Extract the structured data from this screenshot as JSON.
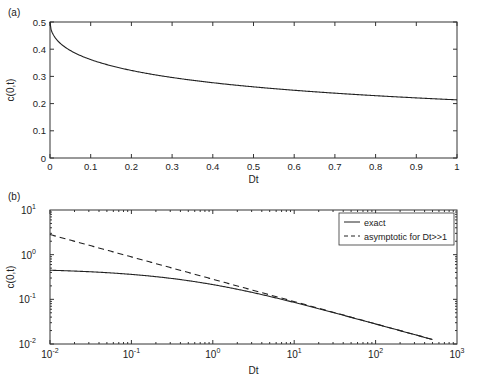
{
  "chart_data": [
    {
      "panel_label": "(a)",
      "type": "line",
      "xlabel": "Dt",
      "ylabel": "c(0,t)",
      "xlim": [
        0,
        1
      ],
      "ylim": [
        0,
        0.5
      ],
      "xticks": [
        "0",
        "0.1",
        "0.2",
        "0.3",
        "0.4",
        "0.5",
        "0.6",
        "0.7",
        "0.8",
        "0.9",
        "1"
      ],
      "yticks": [
        "0",
        "0.1",
        "0.2",
        "0.3",
        "0.4",
        "0.5"
      ],
      "grid": false,
      "series": [
        {
          "name": "exact",
          "style": "solid",
          "x": [
            0,
            0.01,
            0.02,
            0.05,
            0.1,
            0.2,
            0.3,
            0.4,
            0.5,
            0.6,
            0.7,
            0.8,
            0.9,
            1.0
          ],
          "y": [
            0.5,
            0.45,
            0.43,
            0.4,
            0.37,
            0.33,
            0.3,
            0.28,
            0.264,
            0.25,
            0.238,
            0.228,
            0.22,
            0.213
          ]
        }
      ]
    },
    {
      "panel_label": "(b)",
      "type": "line",
      "xscale": "log",
      "yscale": "log",
      "xlabel": "Dt",
      "ylabel": "c(0,t)",
      "xlim": [
        0.01,
        1000
      ],
      "ylim": [
        0.01,
        10
      ],
      "xticks": [
        "10^-2",
        "10^-1",
        "10^0",
        "10^1",
        "10^2",
        "10^3"
      ],
      "yticks": [
        "10^-2",
        "10^-1",
        "10^0",
        "10^1"
      ],
      "legend": {
        "position": "upper right",
        "entries": [
          "exact",
          "asymptotic for Dt>>1"
        ]
      },
      "series": [
        {
          "name": "exact",
          "style": "solid",
          "x": [
            0.01,
            0.03,
            0.1,
            0.3,
            1,
            3,
            10,
            30,
            100,
            500
          ],
          "y": [
            0.45,
            0.42,
            0.37,
            0.31,
            0.213,
            0.14,
            0.085,
            0.05,
            0.028,
            0.0126
          ]
        },
        {
          "name": "asymptotic for Dt>>1",
          "style": "dashed",
          "x": [
            0.01,
            0.1,
            1,
            10,
            100,
            500
          ],
          "y": [
            2.82,
            0.89,
            0.282,
            0.089,
            0.0282,
            0.0126
          ]
        }
      ]
    }
  ],
  "labels": {
    "panel_a": "(a)",
    "panel_b": "(b)",
    "xlabel": "Dt",
    "ylabel": "c(0,t)",
    "legend_exact": "exact",
    "legend_asym": "asymptotic for Dt>>1"
  }
}
